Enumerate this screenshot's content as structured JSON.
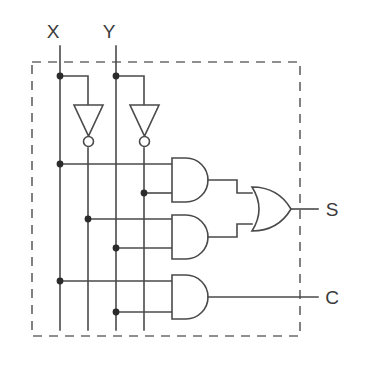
{
  "diagram": {
    "stroke_color": "#4a4a4a",
    "boundary_color": "#6b6b6b",
    "junction_color": "#2b2b2b",
    "background": "#ffffff"
  },
  "inputs": [
    {
      "label": "X",
      "x": 60,
      "label_x": 53,
      "label_y": 38
    },
    {
      "label": "Y",
      "x": 116,
      "label_x": 109,
      "label_y": 38
    }
  ],
  "outputs": [
    {
      "label": "S",
      "x": 332,
      "y": 215,
      "wire_y": 209
    },
    {
      "label": "C",
      "x": 332,
      "y": 303,
      "wire_y": 297
    }
  ],
  "rails": [
    {
      "name": "x-rail",
      "x": 60
    },
    {
      "name": "not-x-rail",
      "x": 88
    },
    {
      "name": "y-rail",
      "x": 116
    },
    {
      "name": "not-y-rail",
      "x": 144
    }
  ],
  "inverters": [
    {
      "name": "inverter-x",
      "input_x": 60,
      "output_x": 88
    },
    {
      "name": "inverter-y",
      "input_x": 116,
      "output_x": 144
    }
  ],
  "and_gates": [
    {
      "name": "and-gate-1",
      "inputs": [
        "X",
        "NOT Y"
      ],
      "y_top": 164,
      "y_bottom": 193,
      "out_y": 180
    },
    {
      "name": "and-gate-2",
      "inputs": [
        "NOT X",
        "Y"
      ],
      "y_top": 219,
      "y_bottom": 248,
      "out_y": 237
    },
    {
      "name": "and-gate-3",
      "inputs": [
        "X",
        "Y"
      ],
      "y_top": 281,
      "y_bottom": 312,
      "out_y": 297
    }
  ],
  "or_gates": [
    {
      "name": "or-gate-sum",
      "inputs": [
        "AND1",
        "AND2"
      ],
      "out_y": 209
    }
  ],
  "junctions": [
    {
      "name": "tap-x-top",
      "x": 60,
      "y": 76
    },
    {
      "name": "tap-y-top",
      "x": 116,
      "y": 76
    },
    {
      "name": "tap-x-and1",
      "x": 60,
      "y": 164
    },
    {
      "name": "tap-noty-and1",
      "x": 144,
      "y": 193
    },
    {
      "name": "tap-notx-and2",
      "x": 88,
      "y": 222
    },
    {
      "name": "tap-y-and2",
      "x": 116,
      "y": 248
    },
    {
      "name": "tap-x-and3",
      "x": 60,
      "y": 281
    },
    {
      "name": "tap-y-and3",
      "x": 116,
      "y": 312
    }
  ],
  "boundary": {
    "name": "module-boundary",
    "x": 32,
    "y": 62,
    "width": 268,
    "height": 274
  }
}
